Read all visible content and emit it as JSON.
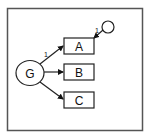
{
  "diagram": {
    "type": "path-diagram",
    "latent": {
      "label": "G"
    },
    "indicators": [
      {
        "label": "A",
        "loading": "1"
      },
      {
        "label": "B",
        "loading": ""
      },
      {
        "label": "C",
        "loading": ""
      }
    ],
    "error_term": {
      "target": "A",
      "loading": "1"
    }
  },
  "colors": {
    "stroke": "#222222",
    "frame": "#555555",
    "background": "#ffffff"
  }
}
